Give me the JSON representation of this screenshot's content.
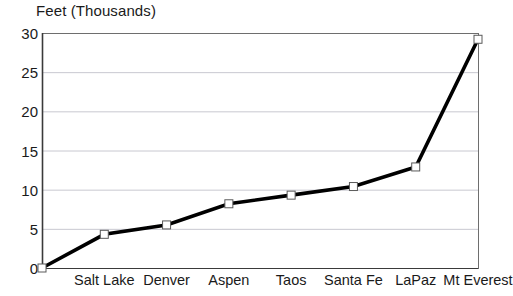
{
  "chart_data": {
    "type": "line",
    "title": "Feet (Thousands)",
    "xlabel": "",
    "ylabel": "",
    "ylim": [
      0,
      30
    ],
    "yticks": [
      0,
      5,
      10,
      15,
      20,
      25,
      30
    ],
    "grid": true,
    "legend": "none",
    "marker": "open-square",
    "line_color": "#000000",
    "grid_color": "#c8c8d0",
    "axis_color": "#6e6e6e",
    "categories": [
      "",
      "Salt Lake",
      "Denver",
      "Aspen",
      "Taos",
      "Santa Fe",
      "LaPaz",
      "Mt Everest"
    ],
    "values": [
      0,
      4.3,
      5.5,
      8.2,
      9.3,
      10.4,
      12.9,
      29.2
    ],
    "points": [
      {
        "label": "",
        "value": 0
      },
      {
        "label": "Salt Lake",
        "value": 4.3
      },
      {
        "label": "Denver",
        "value": 5.5
      },
      {
        "label": "Aspen",
        "value": 8.2
      },
      {
        "label": "Taos",
        "value": 9.3
      },
      {
        "label": "Santa Fe",
        "value": 10.4
      },
      {
        "label": "LaPaz",
        "value": 12.9
      },
      {
        "label": "Mt Everest",
        "value": 29.2
      }
    ]
  }
}
